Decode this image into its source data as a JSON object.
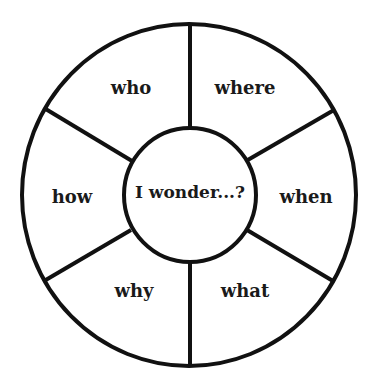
{
  "diagram": {
    "type": "question-wheel",
    "center": {
      "label": "I wonder...?"
    },
    "segments": [
      {
        "id": "who",
        "label": "who",
        "position": "top-left"
      },
      {
        "id": "where",
        "label": "where",
        "position": "top-right"
      },
      {
        "id": "when",
        "label": "when",
        "position": "right"
      },
      {
        "id": "what",
        "label": "what",
        "position": "bottom-right"
      },
      {
        "id": "why",
        "label": "why",
        "position": "bottom-left"
      },
      {
        "id": "how",
        "label": "how",
        "position": "left"
      }
    ],
    "colors": {
      "stroke": "#111111",
      "text": "#1a1a1a",
      "background": "#ffffff"
    }
  }
}
